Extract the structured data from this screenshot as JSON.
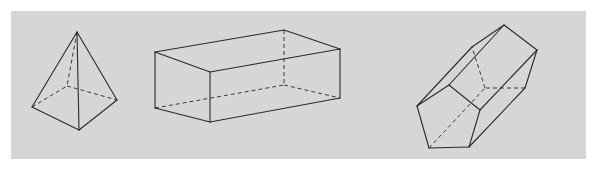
{
  "figure": {
    "panel_color": "#d6d6d6",
    "line_color": "#2a2a2a",
    "shapes": [
      {
        "name": "square-pyramid",
        "vertices": {
          "apex": [
            77,
            32
          ],
          "left": [
            32,
            107
          ],
          "front": [
            79,
            130
          ],
          "right": [
            117,
            100
          ],
          "back": [
            67,
            86
          ]
        },
        "visible_edges": [
          [
            "apex",
            "left"
          ],
          [
            "apex",
            "front"
          ],
          [
            "apex",
            "right"
          ],
          [
            "left",
            "front"
          ],
          [
            "front",
            "right"
          ]
        ],
        "hidden_edges": [
          [
            "apex",
            "back"
          ],
          [
            "left",
            "back"
          ],
          [
            "back",
            "right"
          ]
        ]
      },
      {
        "name": "rectangular-prism",
        "vertices": {
          "tbl": [
            155,
            52
          ],
          "tbr": [
            284,
            30
          ],
          "tfl": [
            210,
            72
          ],
          "tfr": [
            340,
            49
          ],
          "bbl": [
            155,
            108
          ],
          "bbr": [
            284,
            85
          ],
          "bfl": [
            210,
            122
          ],
          "bfr": [
            340,
            98
          ]
        },
        "visible_edges": [
          [
            "tbl",
            "tbr"
          ],
          [
            "tbr",
            "tfr"
          ],
          [
            "tfr",
            "tfl"
          ],
          [
            "tfl",
            "tbl"
          ],
          [
            "tbl",
            "bbl"
          ],
          [
            "tfl",
            "bfl"
          ],
          [
            "tfr",
            "bfr"
          ],
          [
            "bbl",
            "bfl"
          ],
          [
            "bfl",
            "bfr"
          ]
        ],
        "hidden_edges": [
          [
            "tbr",
            "bbr"
          ],
          [
            "bbl",
            "bbr"
          ],
          [
            "bbr",
            "bfr"
          ]
        ]
      },
      {
        "name": "pentagonal-prism",
        "vertices": {
          "A": [
            417,
            106
          ],
          "B": [
            449,
            85
          ],
          "C": [
            480,
            110
          ],
          "D": [
            469,
            147
          ],
          "E": [
            429,
            148
          ],
          "A2": [
            472,
            47
          ],
          "B2": [
            504,
            25
          ],
          "C2": [
            537,
            50
          ],
          "D2": [
            525,
            88
          ],
          "E2": [
            485,
            88
          ]
        },
        "visible_edges": [
          [
            "A",
            "B"
          ],
          [
            "B",
            "C"
          ],
          [
            "C",
            "D"
          ],
          [
            "D",
            "E"
          ],
          [
            "E",
            "A"
          ],
          [
            "A",
            "A2"
          ],
          [
            "B",
            "B2"
          ],
          [
            "C",
            "C2"
          ],
          [
            "D",
            "D2"
          ],
          [
            "A2",
            "B2"
          ],
          [
            "B2",
            "C2"
          ],
          [
            "C2",
            "D2"
          ]
        ],
        "hidden_edges": [
          [
            "E",
            "E2"
          ],
          [
            "D2",
            "E2"
          ],
          [
            "E2",
            "A2"
          ]
        ]
      }
    ]
  }
}
